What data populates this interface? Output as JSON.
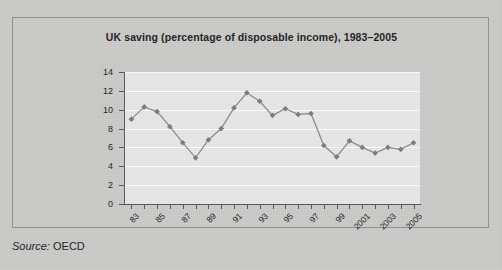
{
  "source": {
    "label": "Source:",
    "value": "OECD"
  },
  "chart_data": {
    "type": "line",
    "title": "UK saving (percentage of disposable income), 1983–2005",
    "xlabel": "",
    "ylabel": "",
    "ylim": [
      0,
      14
    ],
    "yticks": [
      0,
      2,
      4,
      6,
      8,
      10,
      12,
      14
    ],
    "ytick_labels": [
      "0",
      "2",
      "4",
      "6",
      "8",
      "10",
      "12",
      "14"
    ],
    "grid": true,
    "legend": false,
    "xtick_labels": [
      "83",
      "",
      "85",
      "",
      "87",
      "",
      "89",
      "",
      "91",
      "",
      "93",
      "",
      "95",
      "",
      "97",
      "",
      "99",
      "",
      "2001",
      "",
      "2003",
      "",
      "2005"
    ],
    "x": [
      1983,
      1984,
      1985,
      1986,
      1987,
      1988,
      1989,
      1990,
      1991,
      1992,
      1993,
      1994,
      1995,
      1996,
      1997,
      1998,
      1999,
      2000,
      2001,
      2002,
      2003,
      2004,
      2005
    ],
    "categories": [
      "83",
      "84",
      "85",
      "86",
      "87",
      "88",
      "89",
      "90",
      "91",
      "92",
      "93",
      "94",
      "95",
      "96",
      "97",
      "98",
      "99",
      "2000",
      "2001",
      "2002",
      "2003",
      "2004",
      "2005"
    ],
    "values": [
      9.0,
      10.3,
      9.8,
      8.2,
      6.5,
      4.9,
      6.8,
      8.0,
      10.2,
      11.8,
      10.9,
      9.4,
      10.1,
      9.5,
      9.6,
      6.2,
      5.0,
      6.7,
      6.0,
      5.4,
      6.0,
      5.8,
      6.5
    ],
    "line_color": "#8a8a8a",
    "marker_color": "#7a7a7a",
    "plot_bg": "#e7e7e7",
    "grid_color": "#fdfdfd"
  }
}
